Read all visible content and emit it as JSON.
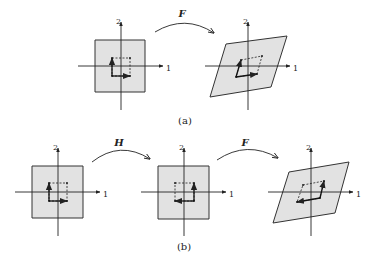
{
  "figure": {
    "fill_color": "#e2e2e2",
    "stroke_color": "#333333",
    "axis_labels": {
      "x": "1",
      "y": "2"
    },
    "panel_a": {
      "caption": "(a)",
      "mapping_label": "F",
      "left": {
        "region": [
          [
            95,
            40
          ],
          [
            145,
            40
          ],
          [
            145,
            92
          ],
          [
            95,
            92
          ]
        ],
        "origin": [
          121,
          66
        ],
        "inner": [
          [
            112,
            58
          ],
          [
            130,
            58
          ],
          [
            130,
            76
          ],
          [
            112,
            76
          ]
        ],
        "arrows": [
          [
            [
              112,
              76
            ],
            [
              130,
              76
            ]
          ],
          [
            [
              112,
              76
            ],
            [
              112,
              58
            ]
          ]
        ]
      },
      "right": {
        "region": [
          [
            226,
            44
          ],
          [
            287,
            36
          ],
          [
            271,
            87
          ],
          [
            210,
            97
          ]
        ],
        "origin": [
          248,
          66
        ],
        "inner": [
          [
            241,
            60
          ],
          [
            262,
            56
          ],
          [
            257,
            74
          ],
          [
            236,
            77
          ]
        ],
        "arrows": [
          [
            [
              236,
              77
            ],
            [
              257,
              74
            ]
          ],
          [
            [
              236,
              77
            ],
            [
              241,
              60
            ]
          ]
        ]
      },
      "arc": {
        "from": [
          155,
          32
        ],
        "ctrl": [
          185,
          14
        ],
        "to": [
          214,
          33
        ],
        "label_pos": [
          182,
          17
        ]
      },
      "caption_pos": [
        185,
        124
      ]
    },
    "panel_b": {
      "caption": "(b)",
      "mapping_labels": [
        "H",
        "F"
      ],
      "left": {
        "region": [
          [
            32,
            166
          ],
          [
            83,
            166
          ],
          [
            83,
            218
          ],
          [
            32,
            218
          ]
        ],
        "origin": [
          58,
          192
        ],
        "inner": [
          [
            49,
            183
          ],
          [
            67,
            183
          ],
          [
            67,
            201
          ],
          [
            49,
            201
          ]
        ],
        "arrows": [
          [
            [
              49,
              201
            ],
            [
              67,
              201
            ]
          ],
          [
            [
              49,
              201
            ],
            [
              49,
              183
            ]
          ]
        ]
      },
      "middle": {
        "region": [
          [
            158,
            166
          ],
          [
            209,
            166
          ],
          [
            209,
            219
          ],
          [
            158,
            219
          ]
        ],
        "origin": [
          184,
          192
        ],
        "inner": [
          [
            175,
            183
          ],
          [
            194,
            183
          ],
          [
            194,
            201
          ],
          [
            175,
            201
          ]
        ],
        "arrows": [
          [
            [
              194,
              201
            ],
            [
              175,
              201
            ]
          ],
          [
            [
              194,
              201
            ],
            [
              194,
              183
            ]
          ]
        ]
      },
      "right": {
        "region": [
          [
            289,
            172
          ],
          [
            349,
            162
          ],
          [
            335,
            213
          ],
          [
            273,
            223
          ]
        ],
        "origin": [
          311,
          192
        ],
        "inner": [
          [
            303,
            185
          ],
          [
            324,
            181
          ],
          [
            320,
            198
          ],
          [
            297,
            202
          ]
        ],
        "arrows": [
          [
            [
              320,
              198
            ],
            [
              297,
              202
            ]
          ],
          [
            [
              320,
              198
            ],
            [
              324,
              181
            ]
          ]
        ]
      },
      "arcs": [
        {
          "label": "H",
          "from": [
            92,
            162
          ],
          "ctrl": [
            120,
            140
          ],
          "to": [
            150,
            159
          ],
          "label_pos": [
            119,
            146
          ]
        },
        {
          "label": "F",
          "from": [
            217,
            160
          ],
          "ctrl": [
            247,
            140
          ],
          "to": [
            278,
            158
          ],
          "label_pos": [
            245,
            146
          ]
        }
      ],
      "caption_pos": [
        184,
        250
      ]
    }
  }
}
